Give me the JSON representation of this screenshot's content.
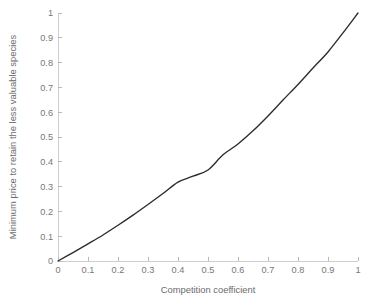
{
  "chart_data": {
    "type": "line",
    "title": "",
    "xlabel": "Competition coefficient",
    "ylabel": "Minimum price to retain the less valuable species",
    "xlim": [
      0,
      1
    ],
    "ylim": [
      0,
      1
    ],
    "grid": false,
    "legend": null,
    "x_ticks": [
      "0",
      "0.1",
      "0.2",
      "0.3",
      "0.4",
      "0.5",
      "0.6",
      "0.7",
      "0.8",
      "0.9",
      "1"
    ],
    "y_ticks": [
      "0",
      "0.1",
      "0.2",
      "0.3",
      "0.4",
      "0.5",
      "0.6",
      "0.7",
      "0.8",
      "0.9",
      "1"
    ],
    "x_tick_values": [
      0,
      0.1,
      0.2,
      0.3,
      0.4,
      0.5,
      0.6,
      0.7,
      0.8,
      0.9,
      1
    ],
    "y_tick_values": [
      0,
      0.1,
      0.2,
      0.3,
      0.4,
      0.5,
      0.6,
      0.7,
      0.8,
      0.9,
      1
    ],
    "series": [
      {
        "name": "Minimum price",
        "color": "#2b2b2b",
        "x": [
          0,
          0.05,
          0.1,
          0.15,
          0.2,
          0.25,
          0.3,
          0.35,
          0.4,
          0.45,
          0.5,
          0.55,
          0.6,
          0.65,
          0.7,
          0.75,
          0.8,
          0.85,
          0.9,
          0.95,
          1
        ],
        "y": [
          0,
          0.034,
          0.069,
          0.105,
          0.144,
          0.185,
          0.228,
          0.272,
          0.318,
          0.342,
          0.367,
          0.428,
          0.472,
          0.525,
          0.585,
          0.649,
          0.712,
          0.778,
          0.843,
          0.92,
          1
        ]
      }
    ]
  },
  "axis_style": {
    "axis_color": "#cfcfcf",
    "tick_color": "#b9b9b9",
    "text_color": "#777777",
    "background": "#ffffff"
  },
  "geometry": {
    "left": 58,
    "right": 358,
    "top": 13,
    "bottom": 261
  }
}
